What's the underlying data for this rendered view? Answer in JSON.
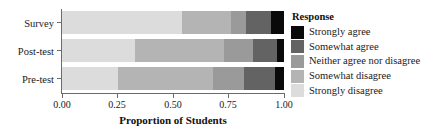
{
  "chart_data": {
    "type": "bar",
    "orientation": "horizontal",
    "stacked": true,
    "normalized": true,
    "title": "",
    "xlabel": "Proportion of Students",
    "ylabel": "",
    "xlim": [
      0.0,
      1.0
    ],
    "xticks": [
      0.0,
      0.25,
      0.5,
      0.75,
      1.0
    ],
    "xticklabels": [
      "0.00",
      "0.25",
      "0.50",
      "0.75",
      "1.00"
    ],
    "grid": false,
    "legend_position": "right",
    "legend_title": "Response",
    "categories": [
      "Survey",
      "Post-test",
      "Pre-test"
    ],
    "category_order_top_to_bottom": [
      "Survey",
      "Post-test",
      "Pre-test"
    ],
    "series": [
      {
        "name": "Strongly disagree",
        "color": "#dcdcdc",
        "values": [
          0.54,
          0.33,
          0.25
        ]
      },
      {
        "name": "Somewhat disagree",
        "color": "#b4b4b4",
        "values": [
          0.22,
          0.4,
          0.43
        ]
      },
      {
        "name": "Neither agree nor disagree",
        "color": "#9a9a9a",
        "values": [
          0.07,
          0.13,
          0.14
        ]
      },
      {
        "name": "Somewhat agree",
        "color": "#636363",
        "values": [
          0.11,
          0.11,
          0.14
        ]
      },
      {
        "name": "Strongly agree",
        "color": "#0a0a0a",
        "values": [
          0.06,
          0.03,
          0.04
        ]
      }
    ],
    "legend_entries": [
      {
        "label": "Strongly agree",
        "color": "#0a0a0a"
      },
      {
        "label": "Somewhat agree",
        "color": "#636363"
      },
      {
        "label": "Neither agree nor disagree",
        "color": "#9a9a9a"
      },
      {
        "label": "Somewhat disagree",
        "color": "#b4b4b4"
      },
      {
        "label": "Strongly disagree",
        "color": "#dcdcdc"
      }
    ]
  },
  "axis": {
    "x_title": "Proportion of Students",
    "tick_labels": [
      "0.00",
      "0.25",
      "0.50",
      "0.75",
      "1.00"
    ],
    "category_labels": [
      "Survey",
      "Post-test",
      "Pre-test"
    ]
  },
  "legend": {
    "title": "Response",
    "items": [
      "Strongly agree",
      "Somewhat agree",
      "Neither agree nor disagree",
      "Somewhat disagree",
      "Strongly disagree"
    ]
  }
}
